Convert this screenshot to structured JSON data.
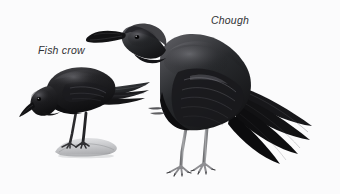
{
  "plate": {
    "width": 340,
    "height": 194,
    "background_color": "#fbfbfc",
    "medium": "greyscale natural history illustration",
    "subject_count": 2
  },
  "labels": {
    "fish_crow": "Fish crow",
    "chough": "Chough",
    "text_color": "#2f3033",
    "style": "italic"
  },
  "subjects": [
    {
      "name": "Fish crow",
      "position": "left",
      "relative_size": "smaller",
      "pose": "hunched forward, head lowered and turned left",
      "perch": "pale grey rock",
      "plumage_color": "#1c1c1e",
      "bill": "straight, medium length, black",
      "legs_color": "#2a2a2c"
    },
    {
      "name": "Chough",
      "position": "right",
      "relative_size": "larger",
      "pose": "upright, head raised, long tail angled down to the right",
      "perch": "ground",
      "plumage_color": "#151517",
      "bill": "long, slender, strongly decurved",
      "legs_color": "#9a9a9c"
    }
  ],
  "palette": {
    "background": "#fbfbfc",
    "feather_dark": "#141416",
    "feather_mid": "#3a3a3d",
    "feather_light": "#6e6e72",
    "highlight": "#b9b9bd",
    "rock": "#cfd0d2",
    "leg_grey": "#9a9a9c"
  }
}
